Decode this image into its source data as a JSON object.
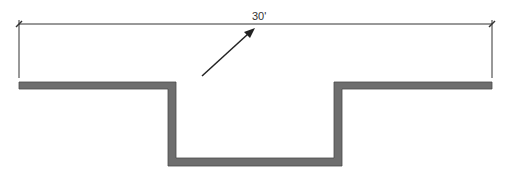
{
  "diagram": {
    "dimension": {
      "label": "30'",
      "x1": 19,
      "x2": 492,
      "y": 24,
      "extension_bottom": 78
    },
    "arrow": {
      "x1": 202,
      "y1": 76,
      "x2": 254,
      "y2": 29
    },
    "wall": {
      "color": "#6e6e6e",
      "stroke": "#4a4a4a",
      "thickness": 8,
      "top_y": 82,
      "left_x": 19,
      "right_x": 492,
      "notch_outer_left": 168,
      "notch_outer_right": 342,
      "notch_bottom": 166
    },
    "colors": {
      "line": "#333333",
      "wall": "#6e6e6e"
    }
  }
}
